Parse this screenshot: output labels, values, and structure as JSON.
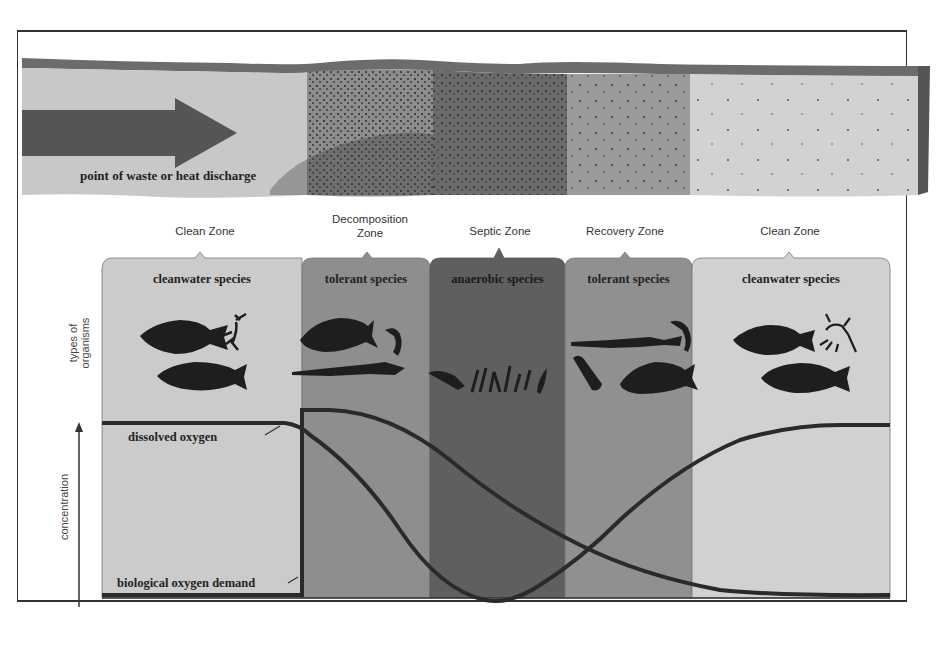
{
  "diagram": {
    "discharge_label": "point of waste or heat discharge",
    "zones": [
      {
        "name": "Clean Zone",
        "species": "cleanwater species",
        "shade": "#c9c9c9"
      },
      {
        "name": "Decomposition Zone",
        "name_line1": "Decomposition",
        "name_line2": "Zone",
        "species": "tolerant species",
        "shade": "#8c8c8c"
      },
      {
        "name": "Septic Zone",
        "species": "anaerobic species",
        "shade": "#5e5e5e"
      },
      {
        "name": "Recovery Zone",
        "species": "tolerant species",
        "shade": "#8f8f8f"
      },
      {
        "name": "Clean Zone",
        "species": "cleanwater species",
        "shade": "#cfcfcf"
      }
    ],
    "y_axis": {
      "organisms_label_line1": "types of",
      "organisms_label_line2": "organisms",
      "concentration_label": "concentration"
    },
    "curves": {
      "dissolved_oxygen_label": "dissolved oxygen",
      "bod_label": "biological oxygen demand"
    },
    "colors": {
      "curve": "#2a2a2a",
      "arrow": "#555555",
      "text": "#222222"
    }
  }
}
